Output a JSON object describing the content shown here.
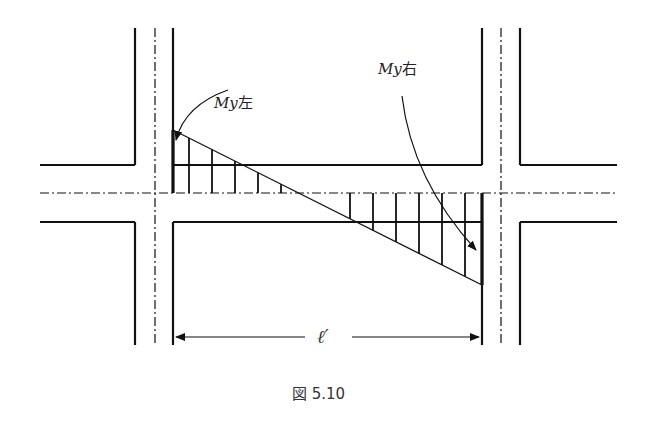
{
  "figure": {
    "caption": "図 5.10",
    "labels": {
      "left_moment": "My左",
      "left_moment_symbol": "My",
      "left_moment_suffix": "左",
      "right_moment": "My右",
      "right_moment_symbol": "My",
      "right_moment_suffix": "右",
      "span": "ℓ′"
    },
    "colors": {
      "line": "#111111",
      "background": "#ffffff"
    }
  }
}
